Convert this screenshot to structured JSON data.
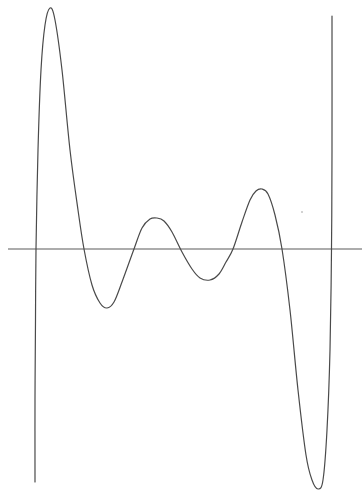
{
  "chart_data": {
    "type": "line",
    "title": "",
    "xlabel": "",
    "ylabel": "",
    "grid": false,
    "legend": null,
    "tick_labels": [],
    "x_axis": {
      "y_px": 249,
      "x_start_px": 8,
      "x_end_px": 362
    },
    "zeros_px": [
      35,
      84,
      134,
      233,
      282,
      332
    ],
    "extrema_px": [
      {
        "kind": "max",
        "x": 50,
        "y": 8
      },
      {
        "kind": "min",
        "x": 107,
        "y": 308
      },
      {
        "kind": "max",
        "x": 157,
        "y": 218
      },
      {
        "kind": "min",
        "x": 210,
        "y": 280
      },
      {
        "kind": "max",
        "x": 262,
        "y": 189
      },
      {
        "kind": "min",
        "x": 318,
        "y": 489
      }
    ],
    "series": [
      {
        "name": "polynomial",
        "points_px": [
          [
            35,
            482
          ],
          [
            35,
            400
          ],
          [
            35.5,
            320
          ],
          [
            36,
            249
          ],
          [
            38,
            150
          ],
          [
            41,
            70
          ],
          [
            45,
            25
          ],
          [
            50,
            8
          ],
          [
            55,
            20
          ],
          [
            62,
            70
          ],
          [
            70,
            150
          ],
          [
            78,
            210
          ],
          [
            84,
            249
          ],
          [
            92,
            285
          ],
          [
            100,
            303
          ],
          [
            107,
            308
          ],
          [
            114,
            302
          ],
          [
            122,
            282
          ],
          [
            134,
            249
          ],
          [
            142,
            228
          ],
          [
            150,
            219
          ],
          [
            157,
            218
          ],
          [
            164,
            221
          ],
          [
            172,
            232
          ],
          [
            182,
            252
          ],
          [
            192,
            269
          ],
          [
            200,
            278
          ],
          [
            210,
            280
          ],
          [
            219,
            274
          ],
          [
            226,
            262
          ],
          [
            233,
            249
          ],
          [
            242,
            222
          ],
          [
            250,
            200
          ],
          [
            256,
            191
          ],
          [
            262,
            189
          ],
          [
            268,
            194
          ],
          [
            275,
            215
          ],
          [
            282,
            249
          ],
          [
            290,
            310
          ],
          [
            298,
            390
          ],
          [
            306,
            455
          ],
          [
            312,
            480
          ],
          [
            318,
            489
          ],
          [
            323,
            480
          ],
          [
            327,
            430
          ],
          [
            330,
            350
          ],
          [
            331.5,
            249
          ],
          [
            332,
            150
          ],
          [
            332,
            16
          ]
        ]
      }
    ]
  },
  "plot": {
    "background": "#ffffff",
    "line_color": "#4a4a4a",
    "axis_color": "#5a5a5a"
  }
}
